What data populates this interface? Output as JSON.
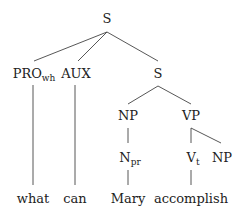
{
  "diagram": {
    "type": "syntax-tree",
    "colors": {
      "line": "#444444",
      "text": "#222222",
      "background": "#ffffff"
    },
    "nodes": {
      "root": {
        "label": "S",
        "sub": ""
      },
      "pro_wh": {
        "label": "PRO",
        "sub": "wh"
      },
      "aux": {
        "label": "AUX",
        "sub": ""
      },
      "s_inner": {
        "label": "S",
        "sub": ""
      },
      "np_subj": {
        "label": "NP",
        "sub": ""
      },
      "vp": {
        "label": "VP",
        "sub": ""
      },
      "n_pr": {
        "label": "N",
        "sub": "pr"
      },
      "v_t": {
        "label": "V",
        "sub": "t"
      },
      "np_obj": {
        "label": "NP",
        "sub": ""
      }
    },
    "leaves": {
      "what": "what",
      "can": "can",
      "mary": "Mary",
      "accomplish": "accomplish"
    },
    "edges": [
      [
        "root",
        "pro_wh"
      ],
      [
        "root",
        "aux"
      ],
      [
        "root",
        "s_inner"
      ],
      [
        "pro_wh",
        "what"
      ],
      [
        "aux",
        "can"
      ],
      [
        "s_inner",
        "np_subj"
      ],
      [
        "s_inner",
        "vp"
      ],
      [
        "np_subj",
        "n_pr"
      ],
      [
        "n_pr",
        "mary"
      ],
      [
        "vp",
        "v_t"
      ],
      [
        "vp",
        "np_obj"
      ],
      [
        "v_t",
        "accomplish"
      ]
    ]
  }
}
